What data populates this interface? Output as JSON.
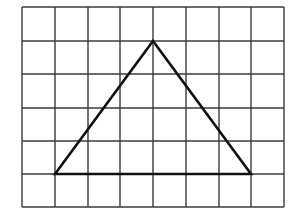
{
  "figure": {
    "background_color": "#ffffff",
    "width": 300,
    "height": 216
  },
  "grid": {
    "name": "square-grid",
    "columns": 8,
    "rows": 6,
    "cell_size": 33,
    "origin_x": 22,
    "origin_y": 7,
    "line_color": "#3a3a3a",
    "line_width": 1.4,
    "vertical_lines_x": [
      22,
      55,
      88,
      120,
      153,
      186,
      219,
      251,
      284
    ],
    "horizontal_lines_y": [
      7,
      41,
      74,
      108,
      141,
      174,
      207
    ]
  },
  "shape": {
    "name": "triangle",
    "type": "isosceles-triangle",
    "stroke_color": "#111111",
    "stroke_width": 2.6,
    "fill": "none",
    "vertices": [
      {
        "label": "bottom-left",
        "x": 55,
        "y": 174,
        "grid_col": 1,
        "grid_row": 5
      },
      {
        "label": "apex",
        "x": 153,
        "y": 41,
        "grid_col": 4,
        "grid_row": 1
      },
      {
        "label": "bottom-right",
        "x": 251,
        "y": 174,
        "grid_col": 7,
        "grid_row": 5
      }
    ],
    "base_cells": 6,
    "height_cells": 4,
    "points_attr": "55,174 153,41 251,174"
  }
}
